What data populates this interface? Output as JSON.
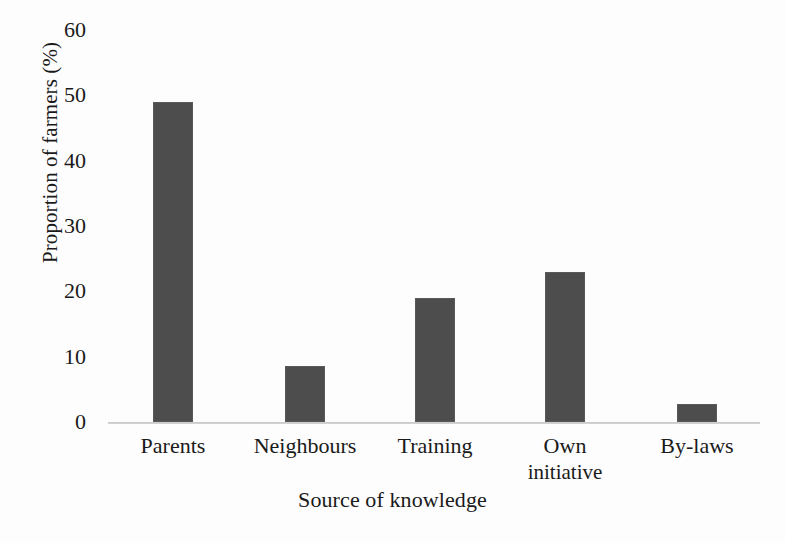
{
  "chart_data": {
    "type": "bar",
    "title": "",
    "subtitle": "",
    "xlabel": "Source of knowledge",
    "ylabel": "Proportion of farmers (%)",
    "categories": [
      "Parents",
      "Neighbours",
      "Training",
      "Own initiative",
      "By-laws"
    ],
    "values": [
      49,
      8.5,
      19,
      23,
      2.7
    ],
    "series": [
      {
        "name": "Proportion of farmers",
        "values": [
          49,
          8.5,
          19,
          23,
          2.7
        ]
      }
    ],
    "ylim": [
      0,
      60
    ],
    "ytick_labels": [
      "0",
      "10",
      "20",
      "30",
      "40",
      "50",
      "60"
    ],
    "ytick_values": [
      0,
      10,
      20,
      30,
      40,
      50,
      60
    ],
    "grid": false,
    "legend": false,
    "legend_position": "none",
    "bar_color": "#4d4d4d",
    "axis_color": "#bfbfbf",
    "background_color": "#fdfdfd",
    "annotations": []
  },
  "category_labels": [
    {
      "line1": "Parents",
      "line2": ""
    },
    {
      "line1": "Neighbours",
      "line2": ""
    },
    {
      "line1": "Training",
      "line2": ""
    },
    {
      "line1": "Own",
      "line2": "initiative"
    },
    {
      "line1": "By-laws",
      "line2": ""
    }
  ]
}
